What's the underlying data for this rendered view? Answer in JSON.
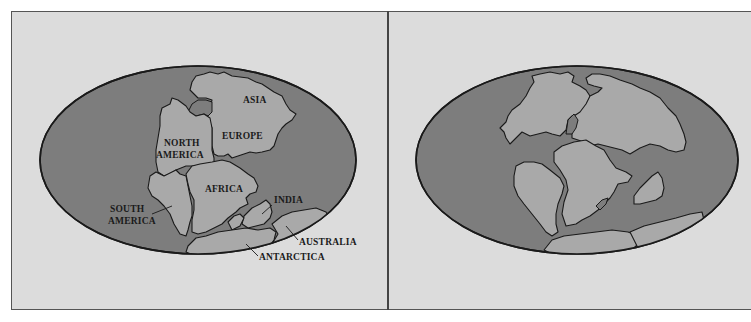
{
  "figure": {
    "panels": [
      {
        "id": "left",
        "description": "Continents labeled in reconstructed configuration",
        "labels": {
          "asia": "ASIA",
          "europe": "EUROPE",
          "north_america_1": "NORTH",
          "north_america_2": "AMERICA",
          "africa": "AFRICA",
          "south_america_1": "SOUTH",
          "south_america_2": "AMERICA",
          "india": "INDIA",
          "australia": "AUSTRALIA",
          "antarctica": "ANTARCTICA"
        }
      },
      {
        "id": "right",
        "description": "Unlabeled continents in drifted configuration",
        "labels": {}
      }
    ],
    "colors": {
      "background": "#dcdcdc",
      "ocean": "#7d7d7d",
      "land": "#a9a9a9",
      "outline": "#1a1a1a"
    }
  }
}
